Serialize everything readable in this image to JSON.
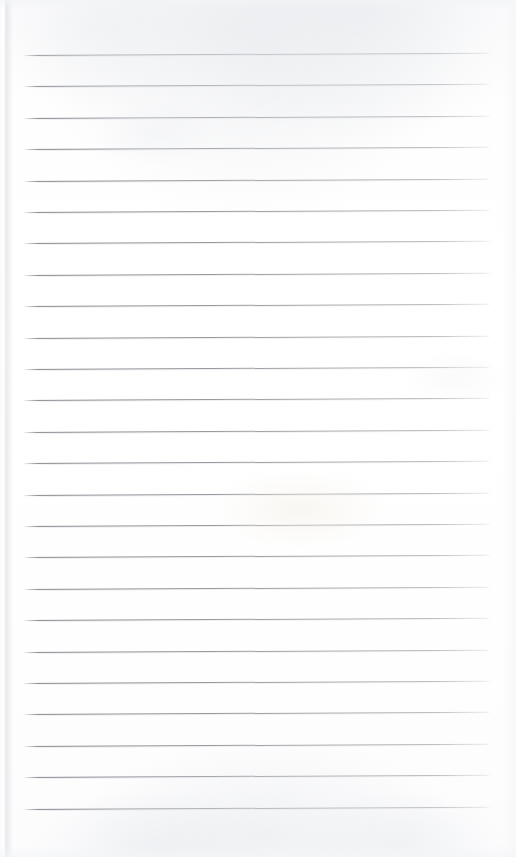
{
  "document": {
    "kind": "scanned-lined-notebook-page",
    "title": "Blank ruled notebook page",
    "page_width": 516,
    "page_height": 857,
    "background_color": "#fefefe",
    "has_text_content": false,
    "written_content": "",
    "visible_text_items": []
  },
  "paper": {
    "surface_color": "#ffffff",
    "shadow_color": "#d6d8dd",
    "texture_tint": "#e7e9ed",
    "left_edge_shadow": true,
    "right_edge_fade": true
  },
  "ruling": {
    "line_color": "#85878d",
    "line_color_faded": "#c4c6cb",
    "line_count": 25,
    "line_spacing_px": 31.4,
    "first_line_y": 55,
    "line_left_x": 24,
    "line_right_x": 491,
    "line_thickness_px": 1,
    "scan_tilt_degrees": -0.28,
    "lines": [
      {
        "index": 1,
        "y": 55
      },
      {
        "index": 2,
        "y": 86
      },
      {
        "index": 3,
        "y": 118
      },
      {
        "index": 4,
        "y": 149
      },
      {
        "index": 5,
        "y": 181
      },
      {
        "index": 6,
        "y": 212
      },
      {
        "index": 7,
        "y": 243
      },
      {
        "index": 8,
        "y": 275
      },
      {
        "index": 9,
        "y": 306
      },
      {
        "index": 10,
        "y": 338
      },
      {
        "index": 11,
        "y": 369
      },
      {
        "index": 12,
        "y": 400
      },
      {
        "index": 13,
        "y": 432
      },
      {
        "index": 14,
        "y": 463
      },
      {
        "index": 15,
        "y": 495
      },
      {
        "index": 16,
        "y": 526
      },
      {
        "index": 17,
        "y": 557
      },
      {
        "index": 18,
        "y": 589
      },
      {
        "index": 19,
        "y": 620
      },
      {
        "index": 20,
        "y": 652
      },
      {
        "index": 21,
        "y": 683
      },
      {
        "index": 22,
        "y": 714
      },
      {
        "index": 23,
        "y": 746
      },
      {
        "index": 24,
        "y": 777
      },
      {
        "index": 25,
        "y": 809
      }
    ]
  }
}
